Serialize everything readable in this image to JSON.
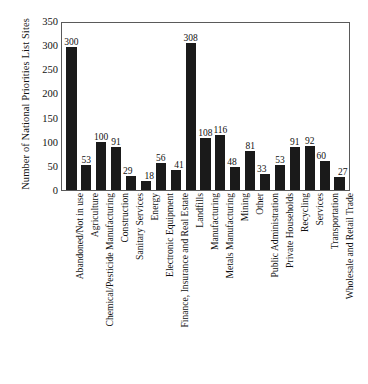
{
  "chart_data": {
    "type": "bar",
    "title": "",
    "xlabel": "",
    "ylabel": "Number of National Priorities List Sites",
    "ylim": [
      0,
      350
    ],
    "yticks": [
      350,
      300,
      250,
      200,
      150,
      100,
      50,
      0
    ],
    "grid": false,
    "legend": null,
    "bar_color": "#1a1a1a",
    "axis_color": "#5a5a5a",
    "background": "#ffffff",
    "value_labels": true,
    "categories": [
      "Abandoned/Not in use",
      "Agriculture",
      "Chemical/Pesticide Manufacturing",
      "Construction",
      "Sanitary Services",
      "Energy",
      "Electronic Equipment",
      "Finance, Insurance and Real Estate",
      "Landfills",
      "Manufacturing",
      "Metals Manufacturing",
      "Mining",
      "Other",
      "Public Administration",
      "Private Households",
      "Recycling",
      "Services",
      "Transportation",
      "Wholesale and Retail Trade"
    ],
    "values": [
      300,
      53,
      100,
      91,
      29,
      18,
      56,
      41,
      308,
      108,
      116,
      48,
      81,
      33,
      53,
      91,
      92,
      60,
      27
    ]
  }
}
